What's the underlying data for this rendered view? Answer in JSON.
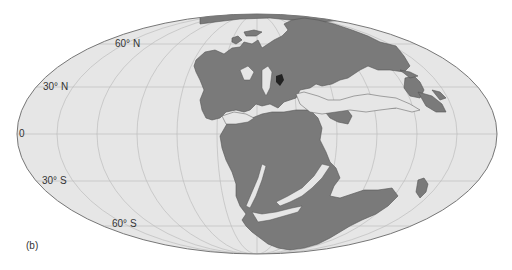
{
  "figure": {
    "panel_label": "(b)",
    "projection": "Mollweide"
  },
  "graticule": {
    "latitude_labels": [
      {
        "text": "60° N",
        "lat": 60
      },
      {
        "text": "30° N",
        "lat": 30
      },
      {
        "text": "0",
        "lat": 0
      },
      {
        "text": "30° S",
        "lat": -30
      },
      {
        "text": "60° S",
        "lat": -60
      }
    ],
    "meridian_spacing_deg": 30
  },
  "colors": {
    "ocean": "#e6e6e6",
    "land": "#7a7a7a",
    "land_outline": "#555555",
    "grid": "#bdbdbd",
    "frame": "#777777",
    "background": "#ffffff",
    "text": "#333333"
  }
}
